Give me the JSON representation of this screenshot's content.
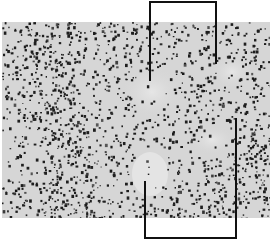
{
  "figure": {
    "type": "histology-micrograph",
    "background_color": "#d9d9d9",
    "nucleus_color": "#1e1e1e",
    "annotations": [
      {
        "name": "top-bracket",
        "left_x": 149,
        "right_x": 216,
        "top_y": 1,
        "left_leg_end_y": 80,
        "right_leg_end_y": 63
      },
      {
        "name": "bottom-bracket",
        "left_x": 144,
        "right_x": 236,
        "bottom_y": 238,
        "left_leg_start_y": 181,
        "right_leg_start_y": 118
      }
    ]
  }
}
